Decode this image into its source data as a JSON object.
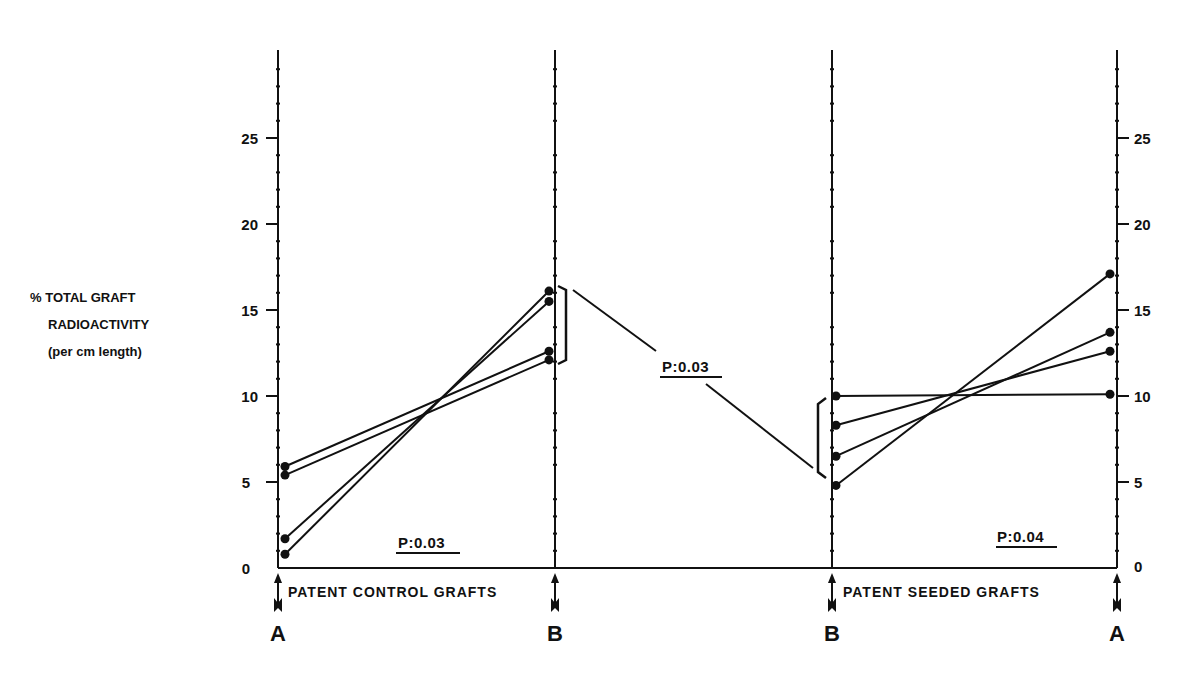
{
  "chart_data": {
    "type": "line",
    "title": "",
    "ylabel": [
      "% TOTAL GRAFT",
      "RADIOACTIVITY",
      "(per cm length)"
    ],
    "ylim": [
      0,
      30
    ],
    "yticks": [
      0,
      5,
      10,
      15,
      20,
      25
    ],
    "grid": false,
    "panels": [
      {
        "name": "PATENT CONTROL GRAFTS",
        "x": [
          "A",
          "B"
        ],
        "series": [
          {
            "name": "control-1",
            "values": [
              5.9,
              12.6
            ]
          },
          {
            "name": "control-2",
            "values": [
              5.4,
              12.1
            ]
          },
          {
            "name": "control-3",
            "values": [
              1.7,
              15.5
            ]
          },
          {
            "name": "control-4",
            "values": [
              0.8,
              16.1
            ]
          }
        ],
        "annotation": "P:0.03"
      },
      {
        "name": "PATENT SEEDED GRAFTS",
        "x": [
          "B",
          "A"
        ],
        "series": [
          {
            "name": "seeded-1",
            "values": [
              10.0,
              10.1
            ]
          },
          {
            "name": "seeded-2",
            "values": [
              8.3,
              12.6
            ]
          },
          {
            "name": "seeded-3",
            "values": [
              6.5,
              13.7
            ]
          },
          {
            "name": "seeded-4",
            "values": [
              4.8,
              17.1
            ]
          }
        ],
        "annotation": "P:0.04"
      }
    ],
    "between_groups_annotation": "P:0.03",
    "between_groups_compares": [
      "control grafts at B",
      "seeded grafts at B"
    ]
  },
  "labels": {
    "ylabel_line1": "% TOTAL GRAFT",
    "ylabel_line2": "RADIOACTIVITY",
    "ylabel_line3": "(per cm length)",
    "control_group": "PATENT CONTROL GRAFTS",
    "seeded_group": "PATENT SEEDED GRAFTS",
    "point_A_left": "A",
    "point_B_left": "B",
    "point_B_right": "B",
    "point_A_right": "A",
    "p_control": "P:0.03",
    "p_between": "P:0.03",
    "p_seeded": "P:0.04",
    "ticks_left": [
      "0",
      "5",
      "10",
      "15",
      "20",
      "25"
    ],
    "ticks_right": [
      "0",
      "5",
      "10",
      "15",
      "20",
      "25"
    ]
  },
  "colors": {
    "ink": "#111111",
    "background": "#ffffff"
  }
}
